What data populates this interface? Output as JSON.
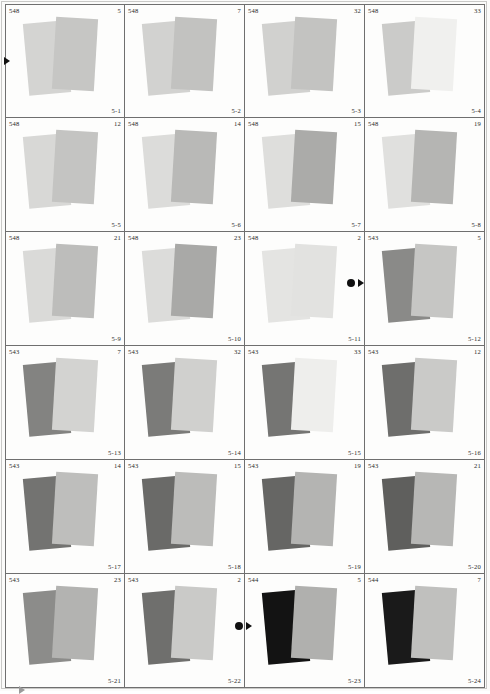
{
  "sheet": {
    "title": "Density patch contact sheet",
    "columns": 4,
    "rows": 6,
    "background": "#fbfbfa",
    "border_color": "#6f6f6f"
  },
  "markers": [
    {
      "name": "left-edge-triangle",
      "glyph": "triangle-right",
      "color": "#101010"
    },
    {
      "name": "row3-dot",
      "glyph": "dot",
      "color": "#101010"
    },
    {
      "name": "row3-triangle",
      "glyph": "triangle-right",
      "color": "#101010"
    },
    {
      "name": "row6-dot",
      "glyph": "dot",
      "color": "#101010"
    },
    {
      "name": "row6-triangle",
      "glyph": "triangle-right",
      "color": "#101010"
    },
    {
      "name": "bottom-edge-triangle",
      "glyph": "triangle-right",
      "color": "#9a9a9a"
    }
  ],
  "cells": [
    {
      "code": "548",
      "number": "5",
      "index": "5-1",
      "left_color": "#d4d4d2",
      "right_color": "#c6c6c4"
    },
    {
      "code": "548",
      "number": "7",
      "index": "5-2",
      "left_color": "#d2d2d0",
      "right_color": "#c2c2c0"
    },
    {
      "code": "548",
      "number": "32",
      "index": "5-3",
      "left_color": "#d1d1cf",
      "right_color": "#c3c3c1"
    },
    {
      "code": "548",
      "number": "33",
      "index": "5-4",
      "left_color": "#cbcbc9",
      "right_color": "#f0f0ee"
    },
    {
      "code": "548",
      "number": "12",
      "index": "5-5",
      "left_color": "#d8d8d6",
      "right_color": "#c4c4c2"
    },
    {
      "code": "548",
      "number": "14",
      "index": "5-6",
      "left_color": "#dcdcda",
      "right_color": "#b9b9b7"
    },
    {
      "code": "548",
      "number": "15",
      "index": "5-7",
      "left_color": "#dededc",
      "right_color": "#ababa9"
    },
    {
      "code": "548",
      "number": "19",
      "index": "5-8",
      "left_color": "#e0e0de",
      "right_color": "#b5b5b3"
    },
    {
      "code": "548",
      "number": "21",
      "index": "5-9",
      "left_color": "#dadad8",
      "right_color": "#bdbdbb"
    },
    {
      "code": "548",
      "number": "23",
      "index": "5-10",
      "left_color": "#dcdcda",
      "right_color": "#a9a9a7"
    },
    {
      "code": "548",
      "number": "2",
      "index": "5-11",
      "left_color": "#e4e4e2",
      "right_color": "#e2e2e0"
    },
    {
      "code": "543",
      "number": "5",
      "index": "5-12",
      "left_color": "#8a8a88",
      "right_color": "#c6c6c4"
    },
    {
      "code": "543",
      "number": "7",
      "index": "5-13",
      "left_color": "#838381",
      "right_color": "#d3d3d1"
    },
    {
      "code": "543",
      "number": "32",
      "index": "5-14",
      "left_color": "#7b7b79",
      "right_color": "#d0d0ce"
    },
    {
      "code": "543",
      "number": "33",
      "index": "5-15",
      "left_color": "#757573",
      "right_color": "#eeeeec"
    },
    {
      "code": "543",
      "number": "12",
      "index": "5-16",
      "left_color": "#6e6e6c",
      "right_color": "#cacac8"
    },
    {
      "code": "543",
      "number": "14",
      "index": "5-17",
      "left_color": "#737371",
      "right_color": "#bebebc"
    },
    {
      "code": "543",
      "number": "15",
      "index": "5-18",
      "left_color": "#6a6a68",
      "right_color": "#bcbcba"
    },
    {
      "code": "543",
      "number": "19",
      "index": "5-19",
      "left_color": "#666664",
      "right_color": "#b4b4b2"
    },
    {
      "code": "543",
      "number": "21",
      "index": "5-20",
      "left_color": "#5f5f5d",
      "right_color": "#b7b7b5"
    },
    {
      "code": "543",
      "number": "23",
      "index": "5-21",
      "left_color": "#8c8c8a",
      "right_color": "#b3b3b1"
    },
    {
      "code": "543",
      "number": "2",
      "index": "5-22",
      "left_color": "#6f6f6d",
      "right_color": "#cacac8"
    },
    {
      "code": "544",
      "number": "5",
      "index": "5-23",
      "left_color": "#131313",
      "right_color": "#b0b0ae"
    },
    {
      "code": "544",
      "number": "7",
      "index": "5-24",
      "left_color": "#1a1a1a",
      "right_color": "#c0c0be"
    }
  ]
}
